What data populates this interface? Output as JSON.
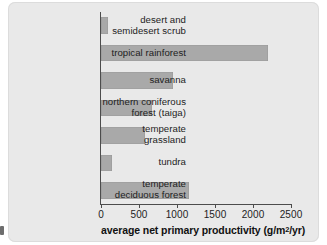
{
  "figure": {
    "background_color": "#e9e9e9",
    "bar_color": "#a9a9a9",
    "axis_color": "#4c4c4c",
    "text_color": "#1d1d1d"
  },
  "axis": {
    "x_title_main": "average net primary productivity (g/m",
    "x_title_sup": "2",
    "x_title_tail": "/yr)",
    "x_title_full": "average net primary productivity (g/m2/yr)",
    "ticks": [
      "0",
      "500",
      "1000",
      "1500",
      "2000",
      "2500"
    ]
  },
  "chart_data": {
    "type": "bar",
    "orientation": "horizontal",
    "title": "",
    "subtitle": "",
    "xlabel": "average net primary productivity (g/m2/yr)",
    "ylabel": "",
    "xlim": [
      0,
      2500
    ],
    "xticks": [
      0,
      500,
      1000,
      1500,
      2000,
      2500
    ],
    "grid": false,
    "legend": null,
    "categories": [
      "desert and semidesert scrub",
      "tropical rainforest",
      "savanna",
      "northern coniferous forest (taiga)",
      "temperate grassland",
      "tundra",
      "temperate deciduous forest"
    ],
    "category_lines": [
      [
        "desert and",
        "semidesert scrub"
      ],
      [
        "tropical rainforest"
      ],
      [
        "savanna"
      ],
      [
        "northern coniferous",
        "forest (taiga)"
      ],
      [
        "temperate",
        "grassland"
      ],
      [
        "tundra"
      ],
      [
        "temperate",
        "deciduous forest"
      ]
    ],
    "values": [
      90,
      2200,
      950,
      670,
      580,
      140,
      1160
    ],
    "units": "g/m2/yr"
  }
}
